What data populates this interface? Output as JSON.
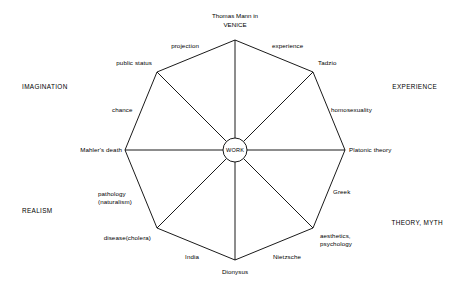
{
  "diagram": {
    "title_line1": "Thomas Mann in",
    "title_line2": "VENICE",
    "hub_label": "WORK",
    "stroke_color": "#000000",
    "background_color": "#ffffff",
    "center": {
      "x": 235,
      "y": 150
    },
    "radius": 110,
    "hub_radius": 12,
    "vertices": [
      {
        "name": "top",
        "label": "",
        "angle_deg": 270,
        "x": 235,
        "y": 40
      },
      {
        "name": "top-right",
        "label": "Tadzio",
        "angle_deg": 315,
        "x": 313,
        "y": 72
      },
      {
        "name": "right",
        "label": "Platonic theory",
        "angle_deg": 0,
        "x": 345,
        "y": 150
      },
      {
        "name": "bottom-right",
        "label": "aesthetics, psychology",
        "angle_deg": 45,
        "x": 313,
        "y": 228
      },
      {
        "name": "bottom",
        "label": "Dionysus",
        "angle_deg": 90,
        "x": 235,
        "y": 260
      },
      {
        "name": "bottom-left",
        "label": "disease(cholera)",
        "angle_deg": 135,
        "x": 157,
        "y": 228
      },
      {
        "name": "left",
        "label": "Mahler's death",
        "angle_deg": 180,
        "x": 125,
        "y": 150
      },
      {
        "name": "top-left",
        "label": "public status",
        "angle_deg": 225,
        "x": 157,
        "y": 72
      }
    ],
    "vertex_labels": {
      "tadzio": "Tadzio",
      "platonic_theory": "Platonic theory",
      "aesthetics_line1": "aesthetics,",
      "aesthetics_line2": "psychology",
      "dionysus": "Dionysus",
      "disease_cholera": "disease(cholera)",
      "mahlers_death": "Mahler's death",
      "public_status": "public status"
    },
    "edge_labels": {
      "projection": "projection",
      "experience": "experience",
      "homosexuality": "homosexuality",
      "greek": "Greek",
      "nietzsche": "Nietzsche",
      "india": "India",
      "pathology_line1": "pathology",
      "pathology_line2": "(naturalism)",
      "chance": "chance"
    },
    "quadrant_labels": {
      "imagination": "IMAGINATION",
      "experience": "EXPERIENCE",
      "realism": "REALISM",
      "theory_myth": "THEORY, MYTH"
    }
  }
}
